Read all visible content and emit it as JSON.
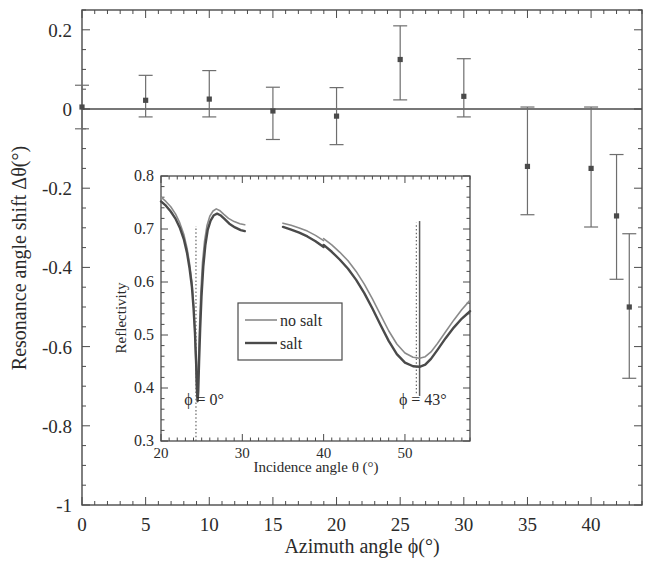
{
  "chart_data": [
    {
      "id": "main",
      "type": "scatter",
      "title": "",
      "xlabel": "Azimuth angle ϕ(°)",
      "ylabel": "Resonance angle shift Δθ(°)",
      "xlim": [
        0,
        44
      ],
      "ylim": [
        -1,
        0.25
      ],
      "xticks": [
        0,
        5,
        10,
        15,
        20,
        25,
        30,
        35,
        40
      ],
      "xticklabels": [
        "0",
        "5",
        "10",
        "15",
        "20",
        "25",
        "30",
        "35",
        "40"
      ],
      "yticks": [
        0.2,
        0,
        -0.2,
        -0.4,
        -0.6,
        -0.8,
        -1
      ],
      "yticklabels": [
        "0.2",
        "0",
        "-0.2",
        "-0.4",
        "-0.6",
        "-0.8",
        "-1"
      ],
      "grid": false,
      "legend": "none",
      "marker": "square",
      "marker_color": "#4a4a4a",
      "errorbar_color": "#6e6e6e",
      "zero_line": 0,
      "x": [
        0,
        5,
        10,
        15,
        20,
        25,
        30,
        35,
        40,
        43
      ],
      "y": [
        0.005,
        0.022,
        0.025,
        -0.005,
        -0.015,
        0.125,
        0.032,
        -0.145,
        -0.15,
        -0.27,
        -0.5
      ],
      "points": [
        {
          "x": 0,
          "y": 0.005,
          "yerr_low": 0.055,
          "yerr_high": 0.055
        },
        {
          "x": 5,
          "y": 0.022,
          "yerr_low": 0.042,
          "yerr_high": 0.063
        },
        {
          "x": 10,
          "y": 0.025,
          "yerr_low": 0.045,
          "yerr_high": 0.072
        },
        {
          "x": 15,
          "y": -0.005,
          "yerr_low": 0.072,
          "yerr_high": 0.06
        },
        {
          "x": 20,
          "y": -0.018,
          "yerr_low": 0.072,
          "yerr_high": 0.072
        },
        {
          "x": 25,
          "y": 0.125,
          "yerr_low": 0.102,
          "yerr_high": 0.085
        },
        {
          "x": 30,
          "y": 0.032,
          "yerr_low": 0.052,
          "yerr_high": 0.095
        },
        {
          "x": 35,
          "y": -0.145,
          "yerr_low": 0.122,
          "yerr_high": 0.15
        },
        {
          "x": 40,
          "y": -0.15,
          "yerr_low": 0.148,
          "yerr_high": 0.155
        },
        {
          "x": 42,
          "y": -0.27,
          "yerr_low": 0.16,
          "yerr_high": 0.155
        },
        {
          "x": 43,
          "y": -0.5,
          "yerr_low": 0.18,
          "yerr_high": 0.185
        }
      ]
    },
    {
      "id": "inset",
      "type": "line",
      "title": "",
      "xlabel": "Incidence angle θ (°)",
      "ylabel": "Reflectivity",
      "xlim": [
        20,
        58
      ],
      "ylim": [
        0.3,
        0.8
      ],
      "xticks": [
        20,
        30,
        40,
        50
      ],
      "xticklabels": [
        "20",
        "30",
        "40",
        "50"
      ],
      "yticks": [
        0.3,
        0.4,
        0.5,
        0.6,
        0.7,
        0.8
      ],
      "yticklabels": [
        "0.3",
        "0.4",
        "0.5",
        "0.6",
        "0.7",
        "0.8"
      ],
      "grid": false,
      "legend_position": "center",
      "legend_entries": [
        {
          "label": "no salt",
          "color": "#8a8a8a",
          "width": 1.6
        },
        {
          "label": "salt",
          "color": "#4a4a4a",
          "width": 2.4
        }
      ],
      "annotations": [
        {
          "text": "ϕ = 0°",
          "x": 25.3,
          "y": 0.368
        },
        {
          "text": "ϕ = 43°",
          "x": 52.2,
          "y": 0.368
        }
      ],
      "marker_lines": [
        {
          "x": 24.3,
          "y0": 0.3,
          "y1": 0.705,
          "style": "dotted"
        },
        {
          "x": 51.4,
          "y0": 0.39,
          "y1": 0.712,
          "style": "dotted"
        },
        {
          "x": 51.8,
          "y0": 0.385,
          "y1": 0.715,
          "style": "solid"
        }
      ],
      "series": [
        {
          "name": "no salt",
          "color": "#8a8a8a",
          "width": 1.6,
          "segments": [
            [
              [
                20.0,
                0.76
              ],
              [
                20.6,
                0.752
              ],
              [
                21.2,
                0.742
              ],
              [
                21.8,
                0.728
              ],
              [
                22.3,
                0.712
              ],
              [
                22.8,
                0.69
              ],
              [
                23.2,
                0.664
              ],
              [
                23.5,
                0.636
              ],
              [
                23.8,
                0.6
              ],
              [
                24.0,
                0.56
              ],
              [
                24.15,
                0.512
              ],
              [
                24.28,
                0.452
              ],
              [
                24.38,
                0.4
              ],
              [
                24.45,
                0.382
              ],
              [
                24.52,
                0.4
              ],
              [
                24.62,
                0.455
              ],
              [
                24.75,
                0.52
              ],
              [
                24.9,
                0.58
              ],
              [
                25.1,
                0.636
              ],
              [
                25.35,
                0.676
              ],
              [
                25.65,
                0.706
              ],
              [
                26.0,
                0.724
              ],
              [
                26.4,
                0.734
              ],
              [
                26.8,
                0.738
              ],
              [
                27.2,
                0.735
              ],
              [
                27.7,
                0.728
              ],
              [
                28.3,
                0.72
              ],
              [
                29.0,
                0.714
              ],
              [
                29.7,
                0.71
              ],
              [
                30.3,
                0.708
              ]
            ],
            [
              [
                35.0,
                0.711
              ],
              [
                36.0,
                0.707
              ],
              [
                37.0,
                0.702
              ],
              [
                38.0,
                0.696
              ],
              [
                39.0,
                0.688
              ],
              [
                40.0,
                0.678
              ]
            ],
            [
              [
                40.0,
                0.682
              ],
              [
                41.0,
                0.67
              ],
              [
                42.0,
                0.656
              ],
              [
                43.0,
                0.64
              ],
              [
                44.0,
                0.62
              ],
              [
                45.0,
                0.596
              ],
              [
                46.0,
                0.568
              ],
              [
                47.0,
                0.538
              ],
              [
                48.0,
                0.508
              ],
              [
                49.0,
                0.483
              ],
              [
                50.0,
                0.466
              ],
              [
                51.0,
                0.458
              ],
              [
                51.8,
                0.456
              ],
              [
                52.5,
                0.459
              ],
              [
                53.2,
                0.468
              ],
              [
                54.0,
                0.484
              ],
              [
                55.0,
                0.506
              ],
              [
                56.0,
                0.528
              ],
              [
                57.0,
                0.548
              ],
              [
                57.8,
                0.562
              ],
              [
                58.0,
                0.566
              ]
            ]
          ]
        },
        {
          "name": "salt",
          "color": "#4a4a4a",
          "width": 2.4,
          "segments": [
            [
              [
                20.0,
                0.752
              ],
              [
                20.6,
                0.744
              ],
              [
                21.2,
                0.733
              ],
              [
                21.8,
                0.719
              ],
              [
                22.3,
                0.703
              ],
              [
                22.8,
                0.681
              ],
              [
                23.2,
                0.655
              ],
              [
                23.5,
                0.627
              ],
              [
                23.8,
                0.591
              ],
              [
                24.0,
                0.551
              ],
              [
                24.18,
                0.503
              ],
              [
                24.33,
                0.443
              ],
              [
                24.43,
                0.392
              ],
              [
                24.5,
                0.375
              ],
              [
                24.58,
                0.393
              ],
              [
                24.68,
                0.448
              ],
              [
                24.82,
                0.513
              ],
              [
                24.98,
                0.573
              ],
              [
                25.2,
                0.629
              ],
              [
                25.45,
                0.669
              ],
              [
                25.75,
                0.699
              ],
              [
                26.1,
                0.716
              ],
              [
                26.5,
                0.726
              ],
              [
                26.9,
                0.729
              ],
              [
                27.3,
                0.726
              ],
              [
                27.8,
                0.719
              ],
              [
                28.4,
                0.71
              ],
              [
                29.1,
                0.703
              ],
              [
                29.8,
                0.698
              ],
              [
                30.3,
                0.696
              ]
            ],
            [
              [
                35.0,
                0.704
              ],
              [
                36.0,
                0.699
              ],
              [
                37.0,
                0.693
              ],
              [
                38.0,
                0.686
              ],
              [
                39.0,
                0.677
              ],
              [
                40.0,
                0.666
              ]
            ],
            [
              [
                40.0,
                0.67
              ],
              [
                41.0,
                0.657
              ],
              [
                42.0,
                0.642
              ],
              [
                43.0,
                0.625
              ],
              [
                44.0,
                0.604
              ],
              [
                45.0,
                0.579
              ],
              [
                46.0,
                0.55
              ],
              [
                47.0,
                0.519
              ],
              [
                48.0,
                0.489
              ],
              [
                49.0,
                0.464
              ],
              [
                50.0,
                0.448
              ],
              [
                51.0,
                0.441
              ],
              [
                51.8,
                0.44
              ],
              [
                52.5,
                0.444
              ],
              [
                53.2,
                0.455
              ],
              [
                54.0,
                0.472
              ],
              [
                55.0,
                0.494
              ],
              [
                56.0,
                0.514
              ],
              [
                57.0,
                0.531
              ],
              [
                57.8,
                0.542
              ],
              [
                58.0,
                0.545
              ]
            ]
          ]
        }
      ]
    }
  ],
  "figure": {
    "background": "#ffffff",
    "axis_color": "#4a4a4a"
  }
}
